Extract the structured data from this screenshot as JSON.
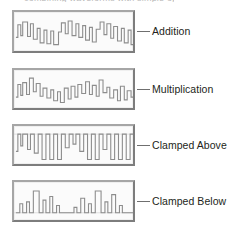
{
  "figure": {
    "clipped_caption": "combining waveforms with simple operations",
    "accent_color": "#8d8d8d",
    "label_color": "#231f20",
    "panel_fill": "#fbfbfb",
    "panel_border_light": "#a6a6a6",
    "panel_border_dark": "#7d7d7d",
    "leader_color": "#6f6f6f"
  },
  "panels": [
    {
      "id": "addition",
      "label": "Addition",
      "geometry": {
        "x": 12,
        "y": 10,
        "width": 123,
        "height": 43
      },
      "label_y": 31,
      "baseline": "",
      "wave": "M2,28 L4,28 L4,14 L7,14 L7,26 L9,26 L9,11 L14,11 L14,27 L17,27 L17,13 L20,13 L20,30 L24,30 L24,18 L27,18 L27,34 L31,34 L31,20 L34,20 L34,35 L38,35 L38,21 L41,21 L41,36 L46,36 L46,22 L49,22 L49,12 L53,12 L53,24 L56,24 L56,10 L60,10 L60,26 L64,26 L64,13 L67,13 L67,28 L71,28 L71,15 L74,15 L74,31 L78,31 L78,17 L81,17 L81,33 L85,33 L85,19 L89,19 L89,11 L93,11 L93,25 L96,25 L96,13 L100,13 L100,29 L103,29 L103,16 L107,16 L107,32 L111,32 L111,18 L114,18 L114,34 L118,34 L118,20 L121,20 L121,36 L123,36"
    },
    {
      "id": "multiplication",
      "label": "Multiplication",
      "geometry": {
        "x": 12,
        "y": 68,
        "width": 123,
        "height": 42
      },
      "label_y": 89,
      "baseline": "",
      "wave": "M2,30 L4,30 L4,16 L7,16 L7,28 L9,28 L9,14 L13,14 L13,27 L16,27 L16,9 L20,9 L20,24 L23,24 L23,15 L27,15 L27,29 L30,29 L30,20 L34,20 L34,31 L38,31 L38,22 L41,22 L41,34 L45,34 L45,24 L48,24 L48,36 L52,36 L52,20 L56,20 L56,32 L59,32 L59,18 L63,18 L63,30 L66,30 L66,16 L70,16 L70,26 L74,26 L74,13 L78,13 L78,27 L81,27 L81,17 L85,17 L85,29 L88,29 L88,11 L92,11 L92,25 L96,25 L96,19 L99,19 L99,31 L103,31 L103,22 L107,22 L107,34 L110,34 L110,18 L114,18 L114,33 L117,33 L117,23 L121,23 L121,30 L123,30"
    },
    {
      "id": "clamped-above",
      "label": "Clamped Above",
      "geometry": {
        "x": 12,
        "y": 124,
        "width": 123,
        "height": 42
      },
      "label_y": 145,
      "baseline": "M0,9 L123,9",
      "wave": "M2,28 L4,28 L4,9 L7,9 L7,22 L9,22 L9,9 L14,9 L14,26 L17,26 L17,9 L21,9 L21,30 L25,30 L25,9 L29,9 L29,37 L33,37 L33,9 L37,9 L37,37 L41,37 L41,9 L45,9 L45,37 L49,37 L49,9 L53,9 L53,24 L57,24 L57,9 L61,9 L61,20 L64,20 L64,9 L68,9 L68,28 L72,28 L72,9 L76,9 L76,37 L80,37 L80,9 L84,9 L84,37 L88,37 L88,9 L92,9 L92,26 L96,26 L96,9 L100,9 L100,37 L104,37 L104,9 L108,9 L108,37 L112,37 L112,9 L116,9 L116,37 L120,37 L120,9 L123,9"
    },
    {
      "id": "clamped-below",
      "label": "Clamped Below",
      "geometry": {
        "x": 12,
        "y": 180,
        "width": 123,
        "height": 42
      },
      "label_y": 201,
      "baseline": "M0,34 L123,34",
      "wave": "M2,34 L6,34 L6,24 L9,24 L9,34 L13,34 L13,22 L16,22 L16,34 L20,34 L20,10 L26,10 L26,34 L30,34 L30,20 L33,20 L33,34 L37,34 L37,16 L40,16 L40,34 L44,34 L44,26 L47,26 L47,34 L62,34 L62,28 L65,28 L65,34 L69,34 L69,18 L73,18 L73,34 L77,34 L77,24 L80,24 L80,34 L84,34 L84,10 L90,10 L90,34 L94,34 L94,22 L97,22 L97,34 L101,34 L101,14 L105,14 L105,34 L109,34 L109,26 L112,26 L112,34 L123,34"
    }
  ],
  "chart_data": {
    "type": "line",
    "title": "Combining waveforms with simple operations",
    "xlabel": "",
    "ylabel": "",
    "panel_count": 4,
    "series": [
      {
        "name": "Addition",
        "description": "Sum of two waveforms producing a jagged stepped trace with varying peak heights, unclamped"
      },
      {
        "name": "Multiplication",
        "description": "Product of two waveforms producing modulated amplitude peaks of uneven height"
      },
      {
        "name": "Clamped Above",
        "description": "Waveform limited by an upper ceiling; all peaks flatten at the top boundary line"
      },
      {
        "name": "Clamped Below",
        "description": "Waveform limited by a lower floor; troughs flatten at the baseline leaving isolated peaks"
      }
    ],
    "legend_position": "right",
    "grid": false
  }
}
